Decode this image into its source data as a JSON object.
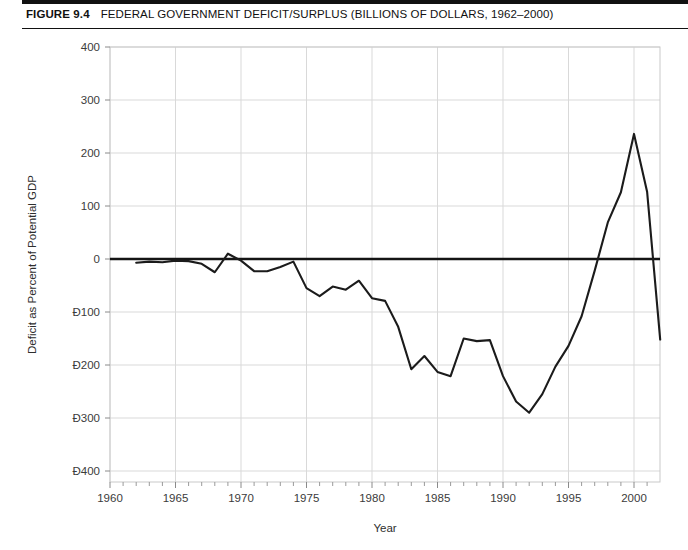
{
  "figure": {
    "number_label": "FIGURE 9.4",
    "title": "FEDERAL GOVERNMENT DEFICIT/SURPLUS (BILLIONS OF DOLLARS, 1962–2000)"
  },
  "chart_data": {
    "type": "line",
    "title": "Federal Government Deficit/Surplus (Billions of Dollars, 1962–2000)",
    "xlabel": "Year",
    "ylabel": "Deficit as Percent of Potential GDP",
    "xlim": [
      1960,
      2002.5
    ],
    "ylim": [
      -400,
      400
    ],
    "ytick_labels": [
      "400",
      "300",
      "200",
      "100",
      "0",
      "Ð100",
      "Ð200",
      "Ð300",
      "Ð400"
    ],
    "ytick_values": [
      400,
      300,
      200,
      100,
      0,
      -100,
      -200,
      -300,
      -400
    ],
    "xtick_labels": [
      "1960",
      "1965",
      "1970",
      "1975",
      "1980",
      "1985",
      "1990",
      "1995",
      "2000"
    ],
    "xtick_values": [
      1960,
      1965,
      1970,
      1975,
      1980,
      1985,
      1990,
      1995,
      2000
    ],
    "minor_xtick_step": 1,
    "grid": true,
    "legend": null,
    "zero_reference_line": 0,
    "series": [
      {
        "name": "Federal deficit/surplus",
        "color": "#1b1b1b",
        "x": [
          1962,
          1963,
          1964,
          1965,
          1966,
          1967,
          1968,
          1969,
          1970,
          1971,
          1972,
          1973,
          1974,
          1975,
          1976,
          1977,
          1978,
          1979,
          1980,
          1981,
          1982,
          1983,
          1984,
          1985,
          1986,
          1987,
          1988,
          1989,
          1990,
          1991,
          1992,
          1993,
          1994,
          1995,
          1996,
          1997,
          1998,
          1999,
          2000,
          2001,
          2002
        ],
        "values": [
          -7,
          -5,
          -6,
          -3,
          -4,
          -9,
          -25,
          10,
          -3,
          -23,
          -23,
          -15,
          -5,
          -55,
          -70,
          -52,
          -58,
          -41,
          -74,
          -79,
          -128,
          -208,
          -183,
          -213,
          -221,
          -150,
          -155,
          -153,
          -221,
          -269,
          -290,
          -255,
          -203,
          -164,
          -108,
          -22,
          69,
          126,
          236,
          127,
          -152
        ],
        "annotations": {
          "peak": {
            "x": 2000,
            "y": 236
          },
          "trough": {
            "x": 1992,
            "y": -290
          }
        }
      }
    ]
  }
}
